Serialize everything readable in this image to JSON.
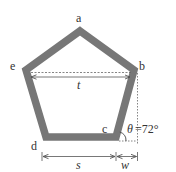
{
  "diagram": {
    "vertices": {
      "a": "a",
      "b": "b",
      "c": "c",
      "d": "d",
      "e": "e"
    },
    "dimensions": {
      "top_width": "t",
      "bottom_width": "s",
      "offset": "w"
    },
    "angle": {
      "symbol": "θ",
      "value_text": "=72°",
      "degrees": 72
    },
    "colors": {
      "frame": "#777777",
      "text": "#333333",
      "guide": "#555555"
    }
  }
}
